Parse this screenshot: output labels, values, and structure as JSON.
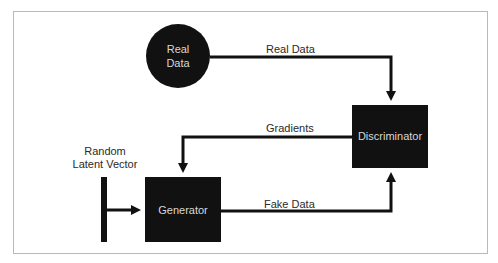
{
  "diagram": {
    "type": "GAN architecture flow",
    "colors": {
      "node_fill": "#111111",
      "node_text": "#d8d8d8",
      "edge": "#111111",
      "label_text": "#2a2a2a",
      "frame_border": "#b9b9b9"
    },
    "nodes": {
      "real_data": {
        "line1": "Real",
        "line2": "Data",
        "shape": "circle"
      },
      "discriminator": {
        "label": "Discriminator",
        "shape": "rectangle"
      },
      "generator": {
        "label": "Generator",
        "shape": "rectangle"
      },
      "latent_vector": {
        "line1": "Random",
        "line2": "Latent Vector",
        "shape": "bar"
      }
    },
    "edges": {
      "real_data": {
        "label": "Real Data",
        "from": "Real Data",
        "to": "Discriminator"
      },
      "gradients": {
        "label": "Gradients",
        "from": "Discriminator",
        "to": "Generator"
      },
      "fake_data": {
        "label": "Fake Data",
        "from": "Generator",
        "to": "Discriminator"
      },
      "latent_input": {
        "label": "",
        "from": "Random Latent Vector",
        "to": "Generator"
      }
    }
  }
}
